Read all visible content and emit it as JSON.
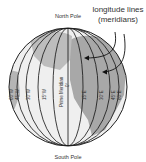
{
  "diagram": {
    "title": "longitude lines",
    "subtitle": "(meridians)",
    "north_pole": "North Pole",
    "south_pole": "South Pole",
    "prime_meridian": "Prime Meridian",
    "prime_meridian_deg": "0°",
    "meridians": [
      {
        "label": "60°W"
      },
      {
        "label": "45°W"
      },
      {
        "label": "30°W"
      },
      {
        "label": "15°W"
      },
      {
        "label": "15°E"
      },
      {
        "label": "30°E"
      },
      {
        "label": "45°E"
      },
      {
        "label": "60°E"
      }
    ],
    "colors": {
      "ocean": "#efefef",
      "land": "#a8a8a8",
      "lines": "#111111"
    }
  }
}
